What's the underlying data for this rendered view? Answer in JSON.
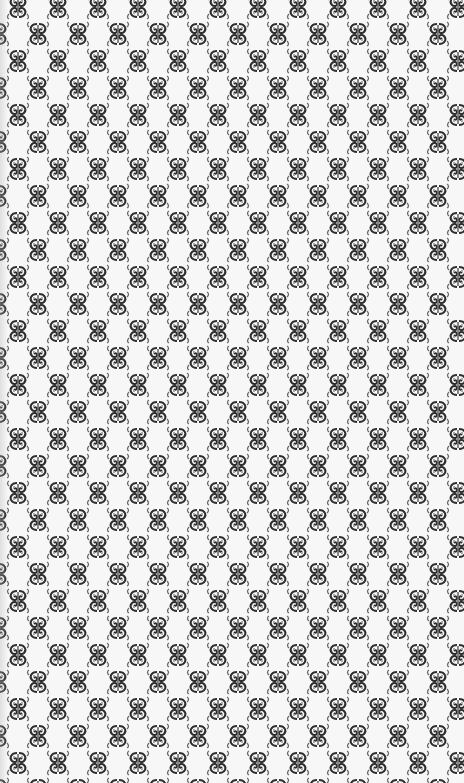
{
  "image": {
    "description": "Repeating ornamental damask-style pattern of mirrored scroll motifs on white paper",
    "width": 464,
    "height": 783
  },
  "pattern": {
    "motif": "mirrored-scroll-ornament",
    "tile_width": 40,
    "tile_height": 54,
    "row_offset": 20,
    "colors": {
      "background": "#f7f7f7",
      "ink_dark": "#2e2e2e",
      "ink_mid": "#6a6a6a",
      "ink_light": "#a8a8a8"
    }
  }
}
